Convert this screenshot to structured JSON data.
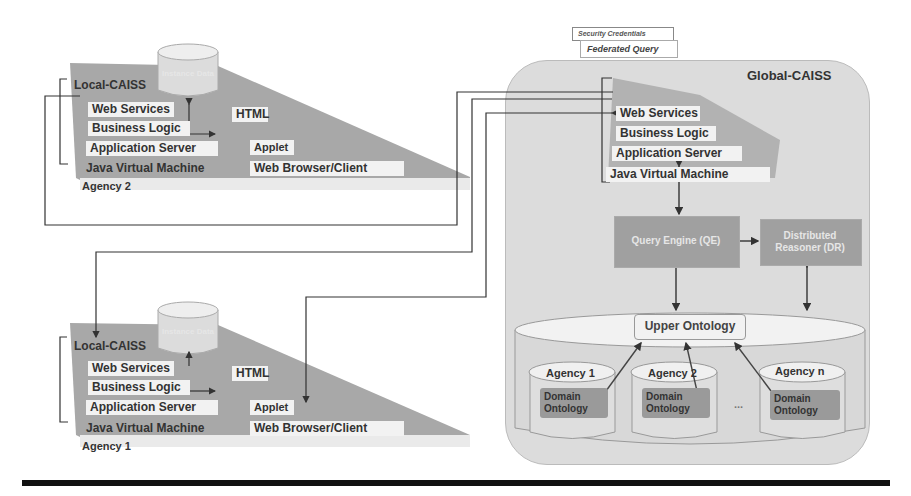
{
  "header": {
    "security_credentials": "Security Credentials",
    "federated_query": "Federated Query"
  },
  "global": {
    "title": "Global-CAISS",
    "stack": [
      "Web Services",
      "Business Logic",
      "Application Server",
      "Java Virtual Machine"
    ],
    "query_engine": "Query Engine (QE)",
    "distributed_reasoner": "Distributed Reasoner (DR)",
    "upper_ontology": "Upper Ontology",
    "agencies": [
      {
        "name": "Agency 1",
        "ontology": "Domain Ontology"
      },
      {
        "name": "Agency 2",
        "ontology": "Domain Ontology"
      },
      {
        "name": "Agency n",
        "ontology": "Domain Ontology"
      }
    ],
    "ellipsis": "..."
  },
  "locals": [
    {
      "title": "Local-CAISS",
      "db": "Instance Data",
      "stack": [
        "Web Services",
        "Business Logic",
        "Application Server",
        "Java Virtual Machine"
      ],
      "html": "HTML",
      "applet": "Applet",
      "browser": "Web Browser/Client",
      "agency": "Agency 2"
    },
    {
      "title": "Local-CAISS",
      "db": "Instance Data",
      "stack": [
        "Web Services",
        "Business Logic",
        "Application Server",
        "Java Virtual Machine"
      ],
      "html": "HTML",
      "applet": "Applet",
      "browser": "Web Browser/Client",
      "agency": "Agency 1"
    }
  ],
  "colors": {
    "panel": "#dcdcdc",
    "wedge": "#a8a8a8",
    "box": "#a0a0a0",
    "line": "#333333",
    "footer_bar": "#111111"
  }
}
